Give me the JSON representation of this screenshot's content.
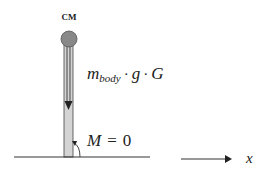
{
  "diagram": {
    "cm_label": "CM",
    "force_label": {
      "m": "m",
      "sub": "body",
      "dot1": "·",
      "g": "g",
      "dot2": "·",
      "G": "G"
    },
    "moment_label": {
      "M": "M",
      "eq": "=",
      "zero": "0"
    },
    "axis_label": "x",
    "colors": {
      "circle_fill": "#888888",
      "circle_stroke": "#555555",
      "rod_fill": "#d4d4d4",
      "line": "#333333"
    }
  }
}
